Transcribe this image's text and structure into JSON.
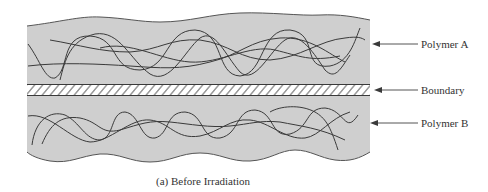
{
  "figure": {
    "caption": "(a) Before Irradiation",
    "labels": {
      "polymer_a": "Polymer A",
      "boundary": "Boundary",
      "polymer_b": "Polymer B"
    },
    "colors": {
      "fill": "#cfcfcf",
      "line": "#3a3a3a",
      "hatch_bg": "#ffffff"
    }
  }
}
